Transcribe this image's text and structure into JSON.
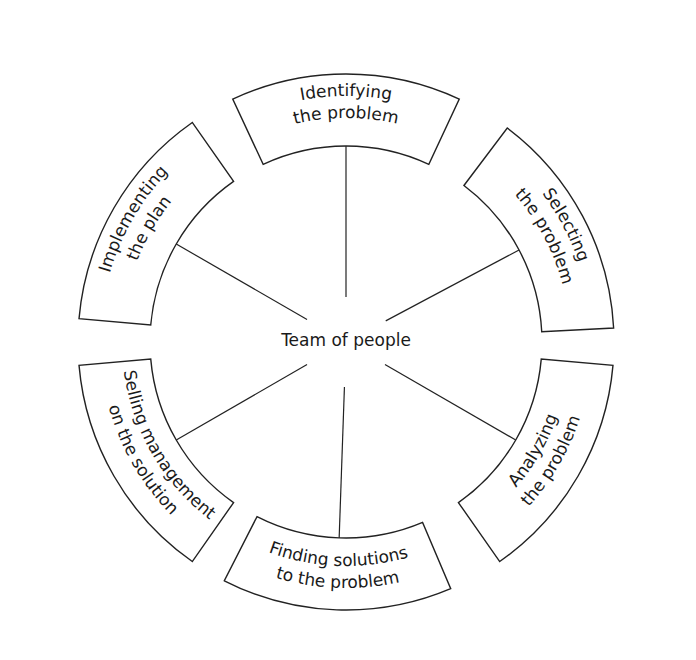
{
  "diagram": {
    "center_label": "Team of people",
    "segments": [
      {
        "id": "identifying",
        "line1": "Identifying",
        "line2": "the problem",
        "angle": -90
      },
      {
        "id": "selecting",
        "line1": "Selecting",
        "line2": "the problem",
        "angle": -28
      },
      {
        "id": "analyzing",
        "line1": "Analyzing",
        "line2": "the problem",
        "angle": 30
      },
      {
        "id": "finding",
        "line1": "Finding solutions",
        "line2": "to the problem",
        "angle": 92
      },
      {
        "id": "selling",
        "line1": "Selling management",
        "line2": "on the solution",
        "angle": 150
      },
      {
        "id": "implementing",
        "line1": "Implementing",
        "line2": "the plan",
        "angle": -150
      }
    ],
    "colors": {
      "stroke": "#222222",
      "text": "#1a1a1a",
      "background": "#ffffff"
    }
  }
}
